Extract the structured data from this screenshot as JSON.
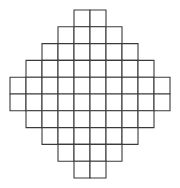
{
  "figure": {
    "name": "stepped-diamond-grid",
    "background_color": "#ffffff",
    "line_color": "#3a3a3a",
    "line_width": 1.1,
    "cell_fill": "#ffffff"
  },
  "chart_data": {
    "type": "heatmap",
    "title": "",
    "subtitle": "",
    "xlabel": "",
    "ylabel": "",
    "grid": true,
    "legend": null,
    "annotations": [],
    "shape": "stepped-diamond",
    "columns": 10,
    "rows": 10,
    "total_cells": 60,
    "cell_width_px": 16,
    "cell_height_px": 16.8,
    "origin_x_px": 10,
    "origin_y_px": 10,
    "xticklabels": [],
    "yticklabels": [],
    "xlim": [
      0,
      10
    ],
    "ylim": [
      0,
      10
    ],
    "row_labels": [
      "row-1",
      "row-2",
      "row-3",
      "row-4",
      "row-5",
      "row-6",
      "row-7",
      "row-8",
      "row-9",
      "row-10"
    ],
    "row_cell_counts": [
      2,
      4,
      6,
      8,
      10,
      10,
      8,
      6,
      4,
      2
    ],
    "row_start_columns": [
      4,
      3,
      2,
      1,
      0,
      0,
      1,
      2,
      3,
      4
    ],
    "rows_detail": [
      {
        "index": 0,
        "cells": 2,
        "start_col": 4,
        "end_col": 5
      },
      {
        "index": 1,
        "cells": 4,
        "start_col": 3,
        "end_col": 6
      },
      {
        "index": 2,
        "cells": 6,
        "start_col": 2,
        "end_col": 7
      },
      {
        "index": 3,
        "cells": 8,
        "start_col": 1,
        "end_col": 8
      },
      {
        "index": 4,
        "cells": 10,
        "start_col": 0,
        "end_col": 9
      },
      {
        "index": 5,
        "cells": 10,
        "start_col": 0,
        "end_col": 9
      },
      {
        "index": 6,
        "cells": 8,
        "start_col": 1,
        "end_col": 8
      },
      {
        "index": 7,
        "cells": 6,
        "start_col": 2,
        "end_col": 7
      },
      {
        "index": 8,
        "cells": 4,
        "start_col": 3,
        "end_col": 6
      },
      {
        "index": 9,
        "cells": 2,
        "start_col": 4,
        "end_col": 5
      }
    ]
  }
}
